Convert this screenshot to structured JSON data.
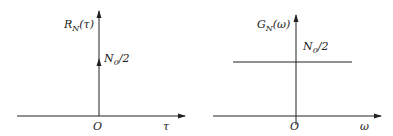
{
  "diagram": {
    "colors": {
      "stroke": "#222222",
      "background": "#ffffff"
    },
    "left_plot": {
      "title": "Autocorrelation of white noise",
      "y_label": {
        "base": "R",
        "sub": "N",
        "arg": "(τ)"
      },
      "x_label": "τ",
      "origin": "O",
      "impulse_label": {
        "base": "N",
        "sub": "0",
        "rest": "/2"
      },
      "shape": "impulse at τ=0"
    },
    "right_plot": {
      "title": "Power spectral density of white noise",
      "y_label": {
        "base": "G",
        "sub": "N",
        "arg": "(ω)"
      },
      "x_label": "ω",
      "origin": "O",
      "level_label": {
        "base": "N",
        "sub": "0",
        "rest": "/2"
      },
      "shape": "constant level N0/2"
    }
  }
}
